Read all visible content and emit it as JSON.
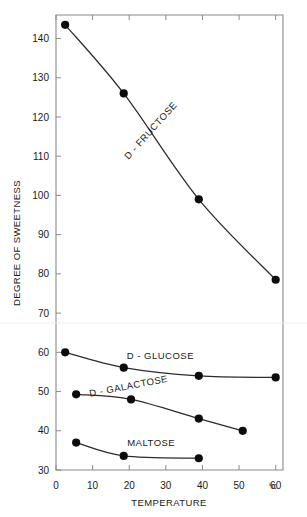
{
  "chart_data": {
    "type": "line",
    "title": "",
    "xlabel": "TEMPERATURE",
    "ylabel": "DEGREE OF SWEETNESS",
    "x_unit": "°C",
    "xlim": [
      0,
      62
    ],
    "ylim": [
      30,
      146
    ],
    "xticks": [
      0,
      10,
      20,
      30,
      40,
      50,
      60
    ],
    "xtick_labels": [
      "0",
      "10",
      "20",
      "30",
      "40",
      "50",
      "60"
    ],
    "yticks": [
      30,
      40,
      50,
      60,
      70,
      80,
      90,
      100,
      110,
      120,
      130,
      140
    ],
    "ytick_labels": [
      "30",
      "40",
      "50",
      "60",
      "70",
      "80",
      "90",
      "100",
      "110",
      "120",
      "130",
      "140"
    ],
    "grid": false,
    "legend_position": "inline-annotations",
    "marker": "filled-circle",
    "series": [
      {
        "name": "D - FRUCTOSE",
        "label_rotation": -48,
        "label_x": 26.5,
        "label_y": 116,
        "points": [
          {
            "x": 2.5,
            "y": 143.5
          },
          {
            "x": 18.5,
            "y": 126.0
          },
          {
            "x": 39.0,
            "y": 99.0
          },
          {
            "x": 60.0,
            "y": 78.5
          }
        ]
      },
      {
        "name": "D - GLUCOSE",
        "label_rotation": 0,
        "label_x": 28.5,
        "label_y": 58.4,
        "points": [
          {
            "x": 2.5,
            "y": 60.0
          },
          {
            "x": 18.5,
            "y": 56.1
          },
          {
            "x": 39.0,
            "y": 54.0
          },
          {
            "x": 60.0,
            "y": 53.6
          }
        ]
      },
      {
        "name": "D - GALACTOSE",
        "label_rotation": -11,
        "label_x": 20.0,
        "label_y": 50.6,
        "points": [
          {
            "x": 5.5,
            "y": 49.3
          },
          {
            "x": 20.5,
            "y": 48.0
          },
          {
            "x": 39.0,
            "y": 43.1
          },
          {
            "x": 51.0,
            "y": 40.0
          }
        ]
      },
      {
        "name": "MALTOSE",
        "label_rotation": 0,
        "label_x": 26.0,
        "label_y": 36.2,
        "points": [
          {
            "x": 5.5,
            "y": 37.0
          },
          {
            "x": 18.5,
            "y": 33.6
          },
          {
            "x": 39.0,
            "y": 33.0
          }
        ]
      }
    ]
  },
  "colors": {
    "background": "#ffffff",
    "frame": "#8a8a8a",
    "curve": "#2b2b2b",
    "marker": "#0d0d0d",
    "text": "#1a1a1a"
  }
}
